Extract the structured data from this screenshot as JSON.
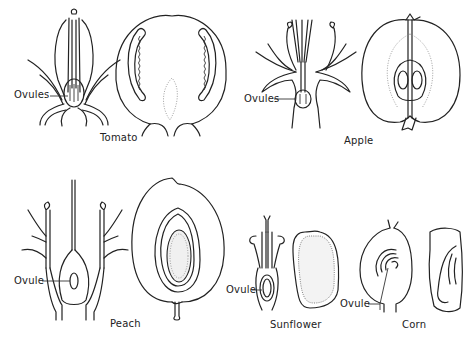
{
  "figure": {
    "specimens": [
      {
        "name": "Tomato",
        "callout": "Ovules"
      },
      {
        "name": "Apple",
        "callout": "Ovules"
      },
      {
        "name": "Peach",
        "callout": "Ovule"
      },
      {
        "name": "Sunflower",
        "callout": "Ovule"
      },
      {
        "name": "Corn",
        "callout": "Ovule"
      }
    ]
  },
  "colors": {
    "ink": "#222222",
    "background": "#ffffff"
  }
}
